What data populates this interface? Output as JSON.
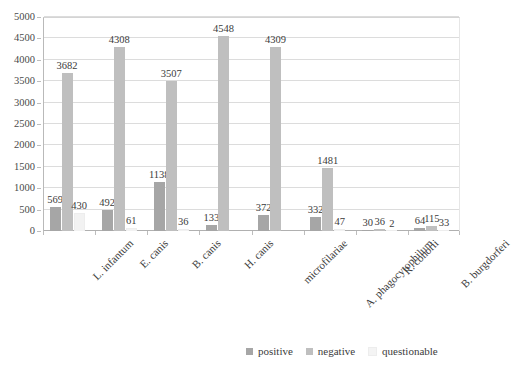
{
  "chart_data": {
    "type": "bar",
    "title": "",
    "subtitle": "",
    "xlabel": "",
    "ylabel": "",
    "ylim": [
      0,
      5000
    ],
    "y_ticks": [
      0,
      500,
      1000,
      1500,
      2000,
      2500,
      3000,
      3500,
      4000,
      4500,
      5000
    ],
    "grid": true,
    "legend_position": "bottom",
    "categories": [
      "L. infantum",
      "E. canis",
      "B. canis",
      "H. canis",
      "microfilariae",
      "A. phagocytophilum",
      "R. conorii",
      "B. burgdorferi"
    ],
    "series": [
      {
        "name": "positive",
        "color": "#a6a6a6",
        "values": [
          569,
          492,
          1138,
          133,
          372,
          332,
          30,
          64
        ]
      },
      {
        "name": "negative",
        "color": "#bfbfbf",
        "values": [
          3682,
          4308,
          3507,
          4548,
          4309,
          1481,
          36,
          115
        ]
      },
      {
        "name": "questionable",
        "color": "#f2f2f2",
        "values": [
          430,
          61,
          36,
          null,
          null,
          47,
          2,
          33
        ]
      }
    ],
    "data_labels": {
      "L. infantum": {
        "positive": "569",
        "negative": "3682",
        "questionable": "430"
      },
      "E. canis": {
        "positive": "492",
        "negative": "4308",
        "questionable": "61"
      },
      "B. canis": {
        "positive": "1138",
        "negative": "3507",
        "questionable": "36"
      },
      "H. canis": {
        "positive": "133",
        "negative": "4548",
        "questionable": ""
      },
      "microfilariae": {
        "positive": "372",
        "negative": "4309",
        "questionable": ""
      },
      "A. phagocytophilum": {
        "positive": "332",
        "negative": "1481",
        "questionable": "47"
      },
      "R. conorii": {
        "positive": "30",
        "negative": "36",
        "questionable": "2"
      },
      "B. burgdorferi": {
        "positive": "64",
        "negative": "115",
        "questionable": "33"
      }
    }
  },
  "legend": {
    "items": [
      {
        "label": "positive",
        "color": "#a6a6a6"
      },
      {
        "label": "negative",
        "color": "#bfbfbf"
      },
      {
        "label": "questionable",
        "color": "#f2f2f2"
      }
    ]
  },
  "axis": {
    "y_tick_labels": [
      "5000",
      "4500",
      "4000",
      "3500",
      "3000",
      "2500",
      "2000",
      "1500",
      "1000",
      "500",
      "0"
    ]
  }
}
